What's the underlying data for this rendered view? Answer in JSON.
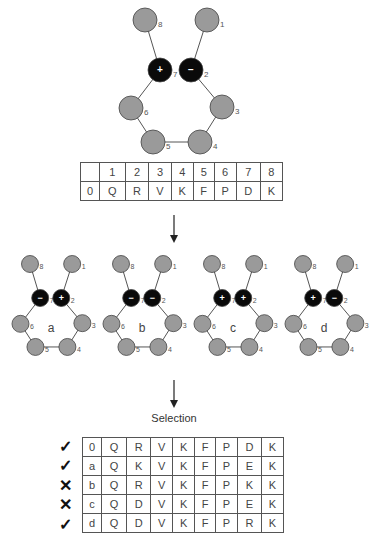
{
  "main_diagram": {
    "nodes": [
      {
        "id": "8",
        "label": "8",
        "type": "neutral",
        "cx": 145,
        "cy": 20
      },
      {
        "id": "1",
        "label": "1",
        "type": "neutral",
        "cx": 207,
        "cy": 20
      },
      {
        "id": "7",
        "label": "7",
        "type": "charged",
        "sign": "+",
        "cx": 160,
        "cy": 70
      },
      {
        "id": "2",
        "label": "2",
        "type": "charged",
        "sign": "−",
        "cx": 191,
        "cy": 70
      },
      {
        "id": "6",
        "label": "6",
        "type": "neutral",
        "cx": 131,
        "cy": 108
      },
      {
        "id": "3",
        "label": "3",
        "type": "neutral",
        "cx": 222,
        "cy": 107
      },
      {
        "id": "5",
        "label": "5",
        "type": "neutral",
        "cx": 153,
        "cy": 142
      },
      {
        "id": "4",
        "label": "4",
        "type": "neutral",
        "cx": 200,
        "cy": 142
      }
    ],
    "edges": [
      [
        "8",
        "7"
      ],
      [
        "7",
        "6"
      ],
      [
        "6",
        "5"
      ],
      [
        "5",
        "4"
      ],
      [
        "4",
        "3"
      ],
      [
        "3",
        "2"
      ],
      [
        "2",
        "1"
      ]
    ]
  },
  "position_table": {
    "header": [
      "",
      "1",
      "2",
      "3",
      "4",
      "5",
      "6",
      "7",
      "8"
    ],
    "row": [
      "0",
      "Q",
      "R",
      "V",
      "K",
      "F",
      "P",
      "D",
      "K"
    ]
  },
  "variants": [
    {
      "label": "a",
      "sign7": "−",
      "sign2": "+"
    },
    {
      "label": "b",
      "sign7": "−",
      "sign2": "−"
    },
    {
      "label": "c",
      "sign7": "+",
      "sign2": "+"
    },
    {
      "label": "d",
      "sign7": "+",
      "sign2": "−"
    }
  ],
  "selection": {
    "label": "Selection",
    "rows": [
      {
        "mark": "✓",
        "status": "selected",
        "cells": [
          "0",
          "Q",
          "R",
          "V",
          "K",
          "F",
          "P",
          "D",
          "K"
        ]
      },
      {
        "mark": "✓",
        "status": "selected",
        "cells": [
          "a",
          "Q",
          "K",
          "V",
          "K",
          "F",
          "P",
          "E",
          "K"
        ]
      },
      {
        "mark": "✕",
        "status": "rejected",
        "cells": [
          "b",
          "Q",
          "R",
          "V",
          "K",
          "F",
          "P",
          "K",
          "K"
        ]
      },
      {
        "mark": "✕",
        "status": "rejected",
        "cells": [
          "c",
          "Q",
          "D",
          "V",
          "K",
          "F",
          "P",
          "E",
          "K"
        ]
      },
      {
        "mark": "✓",
        "status": "selected",
        "cells": [
          "d",
          "Q",
          "D",
          "V",
          "K",
          "F",
          "P",
          "R",
          "K"
        ]
      }
    ]
  },
  "colors": {
    "neutral_fill": "#9a9a9a",
    "charged_fill": "#0a0a0a",
    "stroke": "#555555"
  }
}
